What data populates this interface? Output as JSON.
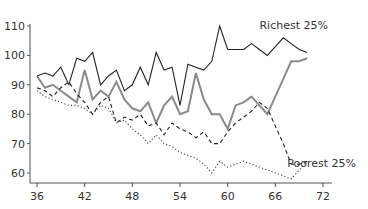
{
  "chart_data": {
    "type": "line",
    "title": "",
    "xlabel": "",
    "ylabel": "",
    "xlim": [
      35,
      73
    ],
    "ylim": [
      56,
      110
    ],
    "x_ticks": [
      36,
      42,
      48,
      54,
      60,
      66,
      72
    ],
    "y_ticks": [
      60,
      70,
      80,
      90,
      100,
      110
    ],
    "grid": false,
    "legend": "inline labels",
    "annotations": [
      {
        "text": "Richest 25%",
        "x": 64,
        "y": 109
      },
      {
        "text": "Poorest 25%",
        "x": 67.5,
        "y": 62
      }
    ],
    "series": [
      {
        "name": "Richest 25%",
        "style": "solid",
        "color": "#222222",
        "x": [
          36,
          37,
          38,
          39,
          40,
          41,
          42,
          43,
          44,
          45,
          46,
          47,
          48,
          49,
          50,
          51,
          52,
          53,
          54,
          55,
          56,
          57,
          58,
          59,
          60,
          61,
          62,
          63,
          64,
          65,
          66,
          67,
          68,
          69,
          70
        ],
        "values": [
          93,
          94,
          93,
          96,
          90,
          99,
          98,
          101,
          90,
          93,
          95,
          88,
          90,
          96,
          90,
          101,
          95,
          96,
          83,
          97,
          96,
          95,
          98,
          110,
          102,
          102,
          102,
          104,
          102,
          100,
          103,
          106,
          104,
          102,
          101
        ]
      },
      {
        "name": "Middle (upper)",
        "style": "solid-thick",
        "color": "#888888",
        "x": [
          36,
          37,
          38,
          39,
          40,
          41,
          42,
          43,
          44,
          45,
          46,
          47,
          48,
          49,
          50,
          51,
          52,
          53,
          54,
          55,
          56,
          57,
          58,
          59,
          60,
          61,
          62,
          63,
          64,
          65,
          66,
          67,
          68,
          69,
          70
        ],
        "values": [
          93,
          89,
          90,
          88,
          86,
          84,
          95,
          85,
          88,
          86,
          91,
          85,
          82,
          81,
          84,
          77,
          83,
          86,
          80,
          81,
          94,
          85,
          80,
          80,
          75,
          83,
          84,
          86,
          83,
          80,
          86,
          92,
          98,
          98,
          99
        ]
      },
      {
        "name": "Middle (lower)",
        "style": "dashed",
        "color": "#222222",
        "x": [
          36,
          37,
          38,
          39,
          40,
          41,
          42,
          43,
          44,
          45,
          46,
          47,
          48,
          49,
          50,
          51,
          52,
          53,
          54,
          55,
          56,
          57,
          58,
          59,
          60,
          61,
          62,
          63,
          64,
          65,
          66,
          67,
          68,
          69,
          70
        ],
        "values": [
          89,
          88,
          86,
          89,
          91,
          87,
          84,
          80,
          84,
          86,
          77,
          79,
          78,
          80,
          76,
          77,
          73,
          77,
          75,
          74,
          72,
          74,
          70,
          70,
          74,
          77,
          79,
          81,
          84,
          82,
          76,
          70,
          63,
          63,
          64
        ]
      },
      {
        "name": "Poorest 25%",
        "style": "dotted",
        "color": "#444444",
        "x": [
          36,
          37,
          38,
          39,
          40,
          41,
          42,
          43,
          44,
          45,
          46,
          47,
          48,
          49,
          50,
          51,
          52,
          53,
          54,
          55,
          56,
          57,
          58,
          59,
          60,
          61,
          62,
          63,
          64,
          65,
          66,
          67,
          68,
          69,
          70
        ],
        "values": [
          88,
          86,
          85,
          84,
          83,
          83,
          82,
          80,
          83,
          82,
          77,
          78,
          75,
          73,
          70,
          73,
          70,
          69,
          67,
          66,
          65,
          63,
          60,
          64,
          62,
          63,
          64,
          63,
          62,
          61,
          60,
          59,
          58,
          61,
          64
        ]
      }
    ]
  }
}
